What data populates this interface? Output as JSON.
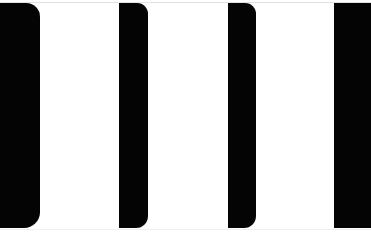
{
  "view": {
    "title": "Zoomed bar region",
    "background_color": "#ffffff",
    "bar_color": "#040404",
    "rule_color": "#e2e2e4",
    "width": 371,
    "height": 234
  },
  "chart_data": {
    "type": "bar",
    "orientation": "vertical-stripes",
    "xlabel": "",
    "ylabel": "",
    "categories": [
      "bar-1",
      "bar-2",
      "bar-3",
      "bar-4"
    ],
    "values": [
      225,
      225,
      225,
      225
    ],
    "grid": false,
    "legend": null,
    "axis_visible": false,
    "bars": [
      {
        "name": "bar-1",
        "x": 0,
        "y": 3,
        "width": 40,
        "height": 225,
        "radius_top_left": 0,
        "radius_top_right": 14,
        "radius_bottom_right": 16,
        "radius_bottom_left": 0,
        "color": "#040404"
      },
      {
        "name": "bar-2",
        "x": 119,
        "y": 3,
        "width": 29,
        "height": 225,
        "radius_top_left": 0,
        "radius_top_right": 11,
        "radius_bottom_right": 12,
        "radius_bottom_left": 0,
        "color": "#040404"
      },
      {
        "name": "bar-3",
        "x": 228,
        "y": 3,
        "width": 28,
        "height": 225,
        "radius_top_left": 0,
        "radius_top_right": 11,
        "radius_bottom_right": 12,
        "radius_bottom_left": 0,
        "color": "#040404"
      },
      {
        "name": "bar-4",
        "x": 334,
        "y": 3,
        "width": 37,
        "height": 225,
        "radius_top_left": 0,
        "radius_top_right": 0,
        "radius_bottom_right": 0,
        "radius_bottom_left": 0,
        "color": "#040404"
      }
    ]
  }
}
